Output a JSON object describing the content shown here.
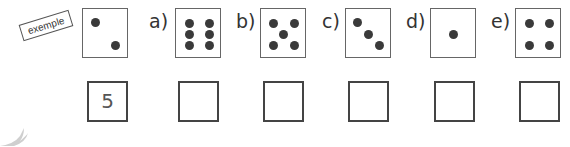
{
  "example_stamp": "exemple",
  "example_answer": "5",
  "dice": [
    {
      "id": "exemple",
      "label": "",
      "pips": 2
    },
    {
      "id": "a",
      "label": "a)",
      "pips": 6
    },
    {
      "id": "b",
      "label": "b)",
      "pips": 5
    },
    {
      "id": "c",
      "label": "c)",
      "pips": 3
    },
    {
      "id": "d",
      "label": "d)",
      "pips": 1
    },
    {
      "id": "e",
      "label": "e)",
      "pips": 4
    }
  ],
  "answers": [
    "5",
    "",
    "",
    "",
    "",
    ""
  ],
  "colors": {
    "pip": "#3a3a3a",
    "border": "#666666"
  }
}
